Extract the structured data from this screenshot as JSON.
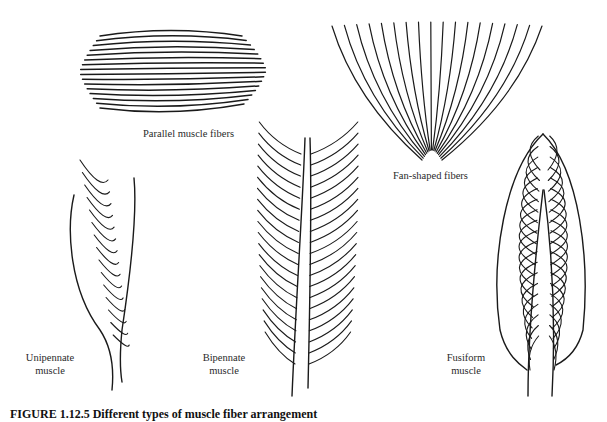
{
  "figure": {
    "caption": "FIGURE 1.12.5 Different types of muscle fiber arrangement",
    "panels": [
      {
        "id": "parallel",
        "label": "Parallel muscle fibers"
      },
      {
        "id": "fan",
        "label": "Fan-shaped fibers"
      },
      {
        "id": "unipennate",
        "label_line1": "Unipennate",
        "label_line2": "muscle"
      },
      {
        "id": "bipennate",
        "label_line1": "Bipennate",
        "label_line2": "muscle"
      },
      {
        "id": "fusiform",
        "label_line1": "Fusiform",
        "label_line2": "muscle"
      }
    ],
    "line_color": "#1a1a1a"
  }
}
